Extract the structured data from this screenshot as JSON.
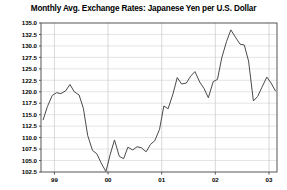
{
  "chart_data": {
    "type": "line",
    "title": "Monthly Avg. Exchange Rates: Japanese Yen per U.S. Dollar",
    "xlabel": "",
    "ylabel": "",
    "ylim": [
      102.5,
      135.0
    ],
    "xlim": [
      1998.75,
      2003.15
    ],
    "grid": true,
    "legend": null,
    "yticks": [
      102.5,
      105.0,
      107.5,
      110.0,
      112.5,
      115.0,
      117.5,
      120.0,
      122.5,
      125.0,
      127.5,
      130.0,
      132.5,
      135.0
    ],
    "ytick_labels": [
      "102.5",
      "105.0",
      "107.5",
      "110.0",
      "112.5",
      "115.0",
      "117.5",
      "120.0",
      "122.5",
      "125.0",
      "127.5",
      "130.0",
      "132.5",
      "135.0"
    ],
    "xticks": [
      1999.0,
      2000.0,
      2001.0,
      2002.0,
      2003.0
    ],
    "xtick_labels": [
      "99",
      "00",
      "01",
      "02",
      "03"
    ],
    "series": [
      {
        "name": "Japanese Yen per U.S. Dollar",
        "color": "#4a4a4a",
        "x": [
          1998.79,
          1998.87,
          1998.96,
          1999.04,
          1999.12,
          1999.21,
          1999.29,
          1999.37,
          1999.46,
          1999.54,
          1999.62,
          1999.71,
          1999.79,
          1999.87,
          1999.96,
          2000.04,
          2000.12,
          2000.21,
          2000.29,
          2000.37,
          2000.46,
          2000.54,
          2000.62,
          2000.71,
          2000.79,
          2000.87,
          2000.96,
          2001.04,
          2001.12,
          2001.21,
          2001.29,
          2001.37,
          2001.46,
          2001.54,
          2001.62,
          2001.71,
          2001.79,
          2001.87,
          2001.96,
          2002.04,
          2002.12,
          2002.21,
          2002.29,
          2002.37,
          2002.46,
          2002.54,
          2002.62,
          2002.71,
          2002.79,
          2002.87,
          2002.96,
          2003.04,
          2003.12
        ],
        "values": [
          113.9,
          116.8,
          119.2,
          119.8,
          119.6,
          120.2,
          121.6,
          120.0,
          119.3,
          116.4,
          110.5,
          107.2,
          106.5,
          104.5,
          102.6,
          106.3,
          109.5,
          105.9,
          105.4,
          107.9,
          107.3,
          108.0,
          107.8,
          106.9,
          108.5,
          109.3,
          111.8,
          116.9,
          116.3,
          119.5,
          123.1,
          121.7,
          121.9,
          123.4,
          124.4,
          122.1,
          120.7,
          118.7,
          122.2,
          122.7,
          127.4,
          131.0,
          133.5,
          132.0,
          130.4,
          130.2,
          126.7,
          118.0,
          119.0,
          121.0,
          123.2,
          121.9,
          120.2
        ]
      }
    ]
  },
  "axes": {
    "plot_left_px": 41,
    "plot_right_px": 277,
    "plot_top_px": 23,
    "plot_bottom_px": 172
  }
}
